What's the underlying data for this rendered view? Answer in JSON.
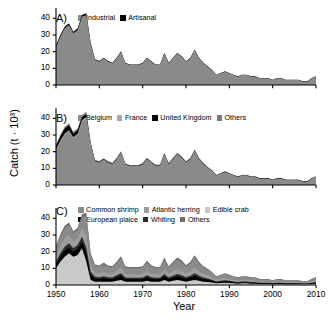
{
  "figure": {
    "ylabel": "Catch (t · 10³)",
    "xlabel": "Year"
  },
  "axis": {
    "yticks": [
      "0",
      "10",
      "20",
      "30",
      "40"
    ],
    "ytick_values": [
      0,
      10,
      20,
      30,
      40
    ],
    "xticks": [
      "1950",
      "1960",
      "1970",
      "1980",
      "1990",
      "2000",
      "2010"
    ],
    "xtick_values": [
      1950,
      1960,
      1970,
      1980,
      1990,
      2000,
      2010
    ],
    "ylim": [
      0,
      45
    ],
    "xlim": [
      1950,
      2010
    ]
  },
  "colors": {
    "industrial": "#8a8a8a",
    "artisanal": "#000000",
    "belgium": "#8a8a8a",
    "france": "#a8a8a8",
    "united_kingdom": "#000000",
    "others_b": "#7a7a7a",
    "common_shrimp": "#8a8a8a",
    "atlantic_herring": "#9e9e9e",
    "edible_crab": "#c9c9c9",
    "european_plaice": "#000000",
    "whiting": "#2b2b2b",
    "others_c": "#6e6e6e",
    "axis": "#000000",
    "background": "#ffffff"
  },
  "panels": [
    {
      "letter": "A)",
      "legend": [
        {
          "label": "Industrial",
          "color": "#8a8a8a"
        },
        {
          "label": "Artisanal",
          "color": "#000000"
        }
      ]
    },
    {
      "letter": "B)",
      "legend": [
        {
          "label": "Belgium",
          "color": "#8a8a8a"
        },
        {
          "label": "France",
          "color": "#a8a8a8"
        },
        {
          "label": "United Kingdom",
          "color": "#000000"
        },
        {
          "label": "Others",
          "color": "#7a7a7a"
        }
      ]
    },
    {
      "letter": "C)",
      "legend_row1": [
        {
          "label": "Common shrimp",
          "color": "#8a8a8a"
        },
        {
          "label": "Atlantic herring",
          "color": "#9e9e9e"
        },
        {
          "label": "Edible crab",
          "color": "#c9c9c9"
        }
      ],
      "legend_row2": [
        {
          "label": "European plaice",
          "color": "#000000"
        },
        {
          "label": "Whiting",
          "color": "#2b2b2b"
        },
        {
          "label": "Others",
          "color": "#6e6e6e"
        }
      ]
    }
  ],
  "chart_data": {
    "type": "area",
    "title": "",
    "xlabel": "Year",
    "ylabel": "Catch (t · 10³)",
    "xlim": [
      1950,
      2010
    ],
    "ylim": [
      0,
      45
    ],
    "grid": false,
    "legend_position": "top-inside",
    "x": [
      1950,
      1951,
      1952,
      1953,
      1954,
      1955,
      1956,
      1957,
      1958,
      1959,
      1960,
      1961,
      1962,
      1963,
      1964,
      1965,
      1966,
      1967,
      1968,
      1969,
      1970,
      1971,
      1972,
      1973,
      1974,
      1975,
      1976,
      1977,
      1978,
      1979,
      1980,
      1981,
      1982,
      1983,
      1984,
      1985,
      1986,
      1987,
      1988,
      1989,
      1990,
      1991,
      1992,
      1993,
      1994,
      1995,
      1996,
      1997,
      1998,
      1999,
      2000,
      2001,
      2002,
      2003,
      2004,
      2005,
      2006,
      2007,
      2008,
      2009,
      2010
    ],
    "panels": [
      {
        "letter": "A)",
        "stacked": true,
        "series": [
          {
            "name": "Industrial",
            "color": "#8a8a8a",
            "values": [
              23,
              29,
              34,
              36,
              31,
              33,
              41,
              42,
              25,
              15,
              14,
              16,
              14,
              13,
              16,
              20,
              13,
              12,
              12,
              12,
              13,
              16,
              14,
              12,
              12,
              19,
              13,
              16,
              19,
              17,
              14,
              16,
              21,
              16,
              13,
              11,
              9,
              6,
              7,
              8,
              7,
              6,
              5,
              6,
              6,
              5,
              5,
              4,
              4,
              4,
              3,
              4,
              4,
              3,
              3,
              3,
              3,
              2,
              2,
              4,
              5
            ]
          },
          {
            "name": "Artisanal",
            "color": "#000000",
            "values": [
              1,
              1,
              1,
              1,
              1,
              1,
              1,
              1,
              0.5,
              0.4,
              0.4,
              0.4,
              0.4,
              0.3,
              0.3,
              0.3,
              0.3,
              0.3,
              0.3,
              0.3,
              0.3,
              0.3,
              0.3,
              0.3,
              0.3,
              0.3,
              0.3,
              0.3,
              0.3,
              0.3,
              0.3,
              0.3,
              0.3,
              0.3,
              0.3,
              0.2,
              0.2,
              0.2,
              0.2,
              0.2,
              0.2,
              0.2,
              0.2,
              0.2,
              0.2,
              0.2,
              0.2,
              0.2,
              0.2,
              0.2,
              0.2,
              0.2,
              0.2,
              0.2,
              0.2,
              0.2,
              0.2,
              0.2,
              0.2,
              0.2,
              0.2
            ]
          }
        ]
      },
      {
        "letter": "B)",
        "stacked": true,
        "series": [
          {
            "name": "Belgium",
            "color": "#8a8a8a",
            "values": [
              21,
              26,
              30,
              32,
              28,
              30,
              38,
              40,
              24,
              14,
              13,
              15,
              13,
              12,
              15,
              19,
              12,
              11,
              11,
              11,
              12,
              15,
              13,
              11,
              11,
              18,
              12,
              15,
              18,
              16,
              13,
              15,
              20,
              15,
              12,
              10,
              8,
              5.5,
              6.5,
              7.5,
              6.5,
              5.5,
              4.5,
              5.5,
              5.5,
              4.5,
              4.5,
              3.6,
              3.6,
              3.6,
              2.7,
              3.6,
              3.6,
              2.7,
              2.7,
              2.7,
              2.7,
              1.8,
              1.8,
              3.6,
              4.6
            ]
          },
          {
            "name": "France",
            "color": "#a8a8a8",
            "values": [
              0.6,
              0.7,
              0.8,
              0.8,
              0.7,
              0.8,
              0.9,
              0.9,
              0.5,
              0.3,
              0.3,
              0.3,
              0.3,
              0.3,
              0.3,
              0.4,
              0.3,
              0.3,
              0.3,
              0.3,
              0.3,
              0.4,
              0.3,
              0.3,
              0.3,
              0.4,
              0.3,
              0.3,
              0.4,
              0.3,
              0.3,
              0.3,
              0.4,
              0.3,
              0.3,
              0.3,
              0.2,
              0.2,
              0.2,
              0.2,
              0.2,
              0.2,
              0.2,
              0.2,
              0.2,
              0.2,
              0.2,
              0.2,
              0.2,
              0.2,
              0.2,
              0.2,
              0.2,
              0.2,
              0.2,
              0.2,
              0.2,
              0.2,
              0.2,
              0.2,
              0.2
            ]
          },
          {
            "name": "United Kingdom",
            "color": "#000000",
            "values": [
              1.8,
              2.5,
              3.0,
              3.0,
              2.0,
              2.0,
              1.8,
              1.5,
              0.6,
              0.4,
              0.3,
              0.3,
              0.3,
              0.3,
              0.3,
              0.3,
              0.3,
              0.3,
              0.3,
              0.3,
              0.3,
              0.3,
              0.3,
              0.3,
              0.3,
              0.3,
              0.3,
              0.3,
              0.3,
              0.3,
              0.3,
              0.3,
              0.3,
              0.3,
              0.3,
              0.2,
              0.2,
              0.2,
              0.2,
              0.2,
              0.2,
              0.2,
              0.2,
              0.2,
              0.2,
              0.2,
              0.2,
              0.2,
              0.2,
              0.2,
              0.2,
              0.2,
              0.2,
              0.2,
              0.2,
              0.2,
              0.2,
              0.2,
              0.2,
              0.2,
              0.2
            ]
          },
          {
            "name": "Others",
            "color": "#7a7a7a",
            "values": [
              0.6,
              0.8,
              1.2,
              1.2,
              1.3,
              1.2,
              1.3,
              1.6,
              0.4,
              0.3,
              0.8,
              0.4,
              0.8,
              0.7,
              0.7,
              0.6,
              0.4,
              0.4,
              0.4,
              0.4,
              0.7,
              0.6,
              0.4,
              0.7,
              0.7,
              0.6,
              0.7,
              0.7,
              0.6,
              0.7,
              0.7,
              0.7,
              0.6,
              0.7,
              0.7,
              0.5,
              0.6,
              0.3,
              0.3,
              0.5,
              0.3,
              0.3,
              0.3,
              0.3,
              0.3,
              0.3,
              0.3,
              0.2,
              0.2,
              0.2,
              0.1,
              0.2,
              0.2,
              0.1,
              0.1,
              0.1,
              0.1,
              0.1,
              0.1,
              0.2,
              0.2
            ]
          }
        ]
      },
      {
        "letter": "C)",
        "stacked": true,
        "series": [
          {
            "name": "Edible crab",
            "color": "#c9c9c9",
            "values": [
              10,
              14,
              17,
              19,
              17,
              18,
              22,
              14,
              3,
              2,
              2,
              2,
              2,
              2,
              2.5,
              3,
              2,
              2,
              2,
              2,
              2,
              2.5,
              2,
              2,
              2,
              3,
              2,
              2.5,
              3,
              2.5,
              2,
              2.5,
              3,
              2.5,
              2,
              1.8,
              1.5,
              1,
              1.2,
              1.3,
              1.2,
              1,
              0.8,
              1,
              1,
              0.8,
              0.8,
              0.6,
              0.6,
              0.6,
              0.5,
              0.6,
              0.6,
              0.5,
              0.5,
              0.5,
              0.5,
              0.4,
              0.4,
              0.6,
              0.8
            ]
          },
          {
            "name": "European plaice",
            "color": "#000000",
            "values": [
              2.5,
              3.0,
              3.5,
              3.5,
              3.0,
              3.5,
              4.0,
              5.0,
              3.0,
              1.8,
              1.6,
              2.0,
              1.6,
              1.5,
              2.0,
              2.5,
              1.5,
              1.4,
              1.4,
              1.4,
              1.5,
              2.0,
              1.6,
              1.4,
              1.4,
              2.2,
              1.5,
              1.9,
              2.2,
              2.0,
              1.6,
              1.9,
              2.5,
              1.9,
              1.5,
              1.3,
              1.0,
              0.7,
              0.8,
              0.9,
              0.8,
              0.7,
              0.6,
              0.7,
              0.7,
              0.6,
              0.6,
              0.5,
              0.5,
              0.5,
              0.4,
              0.5,
              0.5,
              0.4,
              0.4,
              0.4,
              0.4,
              0.3,
              0.3,
              0.5,
              0.6
            ]
          },
          {
            "name": "Whiting",
            "color": "#2b2b2b",
            "values": [
              1.5,
              2.0,
              2.5,
              2.5,
              2.0,
              2.5,
              3.0,
              3.5,
              2.0,
              1.2,
              1.0,
              1.3,
              1.0,
              1.0,
              1.3,
              1.6,
              1.0,
              0.9,
              0.9,
              0.9,
              1.0,
              1.3,
              1.0,
              0.9,
              0.9,
              1.4,
              1.0,
              1.2,
              1.4,
              1.3,
              1.0,
              1.2,
              1.6,
              1.2,
              1.0,
              0.8,
              0.6,
              0.4,
              0.5,
              0.6,
              0.5,
              0.4,
              0.4,
              0.4,
              0.4,
              0.4,
              0.4,
              0.3,
              0.3,
              0.3,
              0.2,
              0.3,
              0.3,
              0.2,
              0.2,
              0.2,
              0.2,
              0.2,
              0.2,
              0.3,
              0.4
            ]
          },
          {
            "name": "Atlantic herring",
            "color": "#9e9e9e",
            "values": [
              3,
              4,
              5,
              5,
              4,
              4,
              5,
              7,
              4,
              2.5,
              2.3,
              2.7,
              2.3,
              2.2,
              2.7,
              3.4,
              2.2,
              2.1,
              2.1,
              2.1,
              2.2,
              2.8,
              2.3,
              2.1,
              2.1,
              3.2,
              2.2,
              2.7,
              3.2,
              2.9,
              2.3,
              2.7,
              3.5,
              2.7,
              2.2,
              1.9,
              1.5,
              1.0,
              1.2,
              1.4,
              1.2,
              1.0,
              0.9,
              1.0,
              1.0,
              0.9,
              0.9,
              0.7,
              0.7,
              0.7,
              0.6,
              0.7,
              0.7,
              0.6,
              0.6,
              0.6,
              0.6,
              0.4,
              0.4,
              0.8,
              1.0
            ]
          },
          {
            "name": "Common shrimp",
            "color": "#8a8a8a",
            "values": [
              5,
              6,
              6,
              6,
              5,
              5,
              7,
              12,
              6,
              4,
              4,
              4.5,
              4,
              3.8,
              4.5,
              5.5,
              3.8,
              3.6,
              3.6,
              3.6,
              3.8,
              4.8,
              4,
              3.6,
              3.6,
              5.5,
              3.8,
              4.6,
              5.5,
              5,
              4,
              4.6,
              6,
              4.6,
              3.8,
              3.2,
              2.6,
              1.8,
              2.0,
              2.4,
              2.0,
              1.8,
              1.5,
              1.7,
              1.7,
              1.5,
              1.5,
              1.2,
              1.2,
              1.2,
              1.0,
              1.2,
              1.2,
              1.0,
              1.0,
              1.0,
              1.0,
              0.8,
              0.8,
              1.3,
              1.6
            ]
          },
          {
            "name": "Others",
            "color": "#6e6e6e",
            "values": [
              1.5,
              1.5,
              1.5,
              1.5,
              1.3,
              1.3,
              1.5,
              1.8,
              1.0,
              0.8,
              0.8,
              1.0,
              0.8,
              0.8,
              1.0,
              1.2,
              0.8,
              0.8,
              0.8,
              0.8,
              0.8,
              1.1,
              0.9,
              0.8,
              0.8,
              1.2,
              0.8,
              1.0,
              1.2,
              1.1,
              0.9,
              1.0,
              1.3,
              1.0,
              0.8,
              0.7,
              0.6,
              0.4,
              0.5,
              0.5,
              0.4,
              0.4,
              0.4,
              0.4,
              0.4,
              0.4,
              0.4,
              0.3,
              0.3,
              0.3,
              0.2,
              0.3,
              0.3,
              0.2,
              0.2,
              0.2,
              0.2,
              0.2,
              0.2,
              0.3,
              0.4
            ]
          }
        ]
      }
    ]
  }
}
